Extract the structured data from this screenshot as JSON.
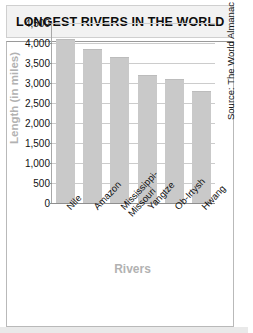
{
  "chart_data": {
    "type": "bar",
    "title": "LONGEST RIVERS IN THE WORLD",
    "xlabel": "Rivers",
    "ylabel": "Length (in miles)",
    "categories": [
      "Nile",
      "Amazon",
      "Mississippi-\nMissouri",
      "Yangtze",
      "Ob-Irtysh",
      "Hwang"
    ],
    "values": [
      4100,
      3850,
      3650,
      3200,
      3100,
      2800
    ],
    "ylim": [
      0,
      4500
    ],
    "ytick_values": [
      0,
      500,
      1000,
      1500,
      2000,
      2500,
      3000,
      3500,
      4000,
      4500
    ],
    "ytick_labels": [
      "0",
      "500",
      "1,000",
      "1,500",
      "2,000",
      "2,500",
      "3,000",
      "3,500",
      "4,000",
      "4,500"
    ],
    "grid": true,
    "legend": false,
    "source": "Source: The World Almanac",
    "bar_color": "#c9c9c9",
    "axis_label_color": "#b2b2b2",
    "grid_color": "#cccccc",
    "title_background": "#f2f2f2"
  }
}
